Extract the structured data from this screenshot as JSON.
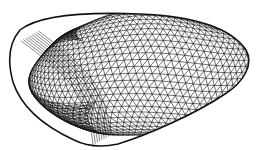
{
  "figure": {
    "width": 258,
    "height": 150,
    "background": "#ffffff",
    "stroke_color": "#111111",
    "outline_path": "M20,30 C40,14 90,12 140,14 C190,16 230,26 246,50 C254,64 244,82 225,94 C195,114 150,134 118,144 C100,148 86,146 74,140 C48,128 22,110 13,82 C8,64 8,44 20,30 Z",
    "fold_path": "M30,36 C55,55 80,75 90,95 C97,110 100,125 102,140",
    "mesh_spacing": 8
  }
}
